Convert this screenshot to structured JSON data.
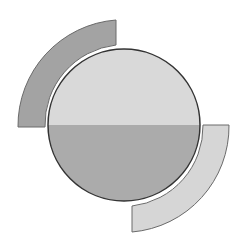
{
  "diagram": {
    "circle": {
      "top_half_color": "#d9d9d9",
      "bottom_half_color": "#ababab",
      "stroke_color": "#333333"
    },
    "arcs": [
      {
        "position": "top-left",
        "color": "#a3a3a3",
        "stroke_color": "#6a6a6a"
      },
      {
        "position": "bottom-right",
        "color": "#d6d6d6",
        "stroke_color": "#6a6a6a"
      }
    ]
  }
}
